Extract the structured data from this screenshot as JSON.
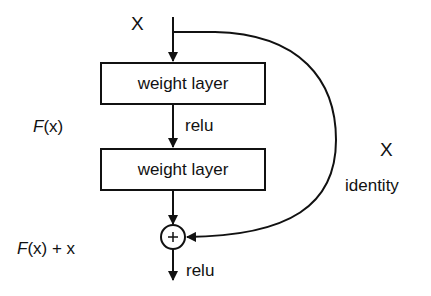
{
  "diagram": {
    "input_label": "X",
    "layers": [
      {
        "label": "weight layer"
      },
      {
        "label": "weight layer"
      }
    ],
    "activation_between": "relu",
    "activation_after": "relu",
    "residual_label_fn": "F",
    "residual_label_arg": "(x)",
    "output_label_fn": "F",
    "output_label_rest": "(x) + x",
    "shortcut_label_x": "X",
    "shortcut_label": "identity",
    "sum_symbol": "+",
    "colors": {
      "stroke": "#111111",
      "background": "#ffffff"
    }
  }
}
